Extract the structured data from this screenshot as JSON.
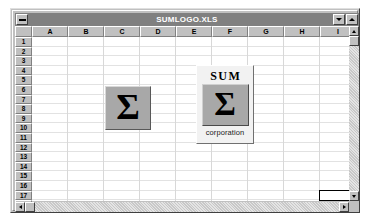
{
  "window": {
    "title": "SUMLOGO.XLS",
    "sysmenu_icon": "system-menu-icon",
    "minimize_icon": "minimize-icon",
    "maximize_icon": "maximize-icon"
  },
  "sheet": {
    "column_headers": [
      "A",
      "B",
      "C",
      "D",
      "E",
      "F",
      "G",
      "H",
      "I"
    ],
    "row_headers": [
      "1",
      "2",
      "3",
      "4",
      "5",
      "6",
      "7",
      "8",
      "9",
      "10",
      "11",
      "12",
      "13",
      "14",
      "15",
      "16",
      "17",
      "18"
    ],
    "selected_cell": "I17"
  },
  "objects": {
    "sigma_plain": {
      "glyph": "Σ",
      "box_color": "#a8a8a8"
    },
    "sum_corporation_logo": {
      "top_word": "SUM",
      "glyph": "Σ",
      "bottom_word": "corporation",
      "box_color": "#a8a8a8",
      "panel_color": "#f2f2f2"
    }
  },
  "scrollbars": {
    "vertical_up_icon": "scroll-up-arrow-icon",
    "vertical_down_icon": "scroll-down-arrow-icon",
    "horizontal_left_icon": "scroll-left-arrow-icon",
    "horizontal_right_icon": "scroll-right-arrow-icon"
  },
  "colors": {
    "titlebar": "#808080",
    "face": "#c0c0c0",
    "grid_bg": "#ffffff",
    "gridline": "#d8d8d8"
  }
}
